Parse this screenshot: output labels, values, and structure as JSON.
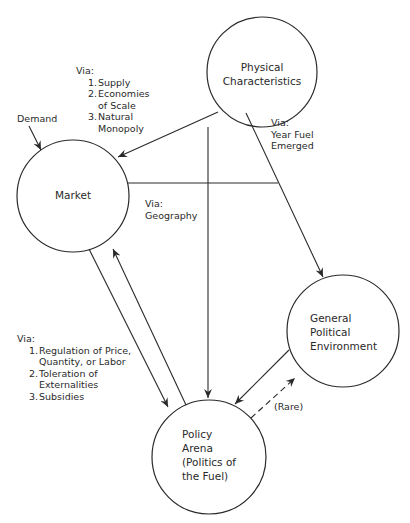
{
  "nodes": {
    "physical": {
      "lines": [
        "Physical",
        "Characteristics"
      ]
    },
    "market": {
      "lines": [
        "Market"
      ]
    },
    "general": {
      "lines": [
        "General",
        "Political",
        "Environment"
      ]
    },
    "policy": {
      "lines": [
        "Policy",
        "Arena",
        "(Politics of",
        "the Fuel)"
      ]
    }
  },
  "annotations": {
    "physical_to_market": {
      "heading": "Via:",
      "items": [
        {
          "num": "1.",
          "text": "Supply"
        },
        {
          "num": "2.",
          "text": "Economies"
        },
        {
          "num": "",
          "text": "of Scale"
        },
        {
          "num": "3.",
          "text": "Natural"
        },
        {
          "num": "",
          "text": "Monopoly"
        }
      ]
    },
    "demand": "Demand",
    "year_fuel": {
      "heading": "Via:",
      "lines": [
        "Year Fuel",
        "Emerged"
      ]
    },
    "geography": {
      "heading": "Via:",
      "lines": [
        "Geography"
      ]
    },
    "market_to_policy": {
      "heading": "Via:",
      "items": [
        {
          "num": "1.",
          "text": "Regulation of Price,"
        },
        {
          "num": "",
          "text": "Quantity, or Labor"
        },
        {
          "num": "2.",
          "text": "Toleration of"
        },
        {
          "num": "",
          "text": "Externalities"
        },
        {
          "num": "3.",
          "text": "Subsidies"
        }
      ]
    },
    "rare": "(Rare)"
  },
  "colors": {
    "stroke": "#2a2a2a",
    "background": "#ffffff"
  }
}
